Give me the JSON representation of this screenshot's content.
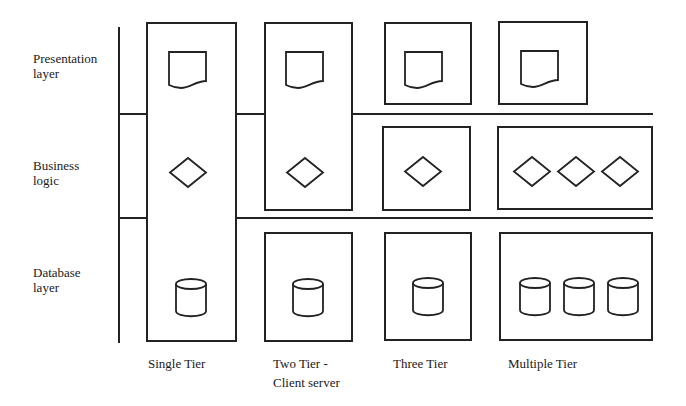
{
  "diagram": {
    "type": "tier-architecture-comparison",
    "rows": [
      {
        "id": "presentation",
        "label_line1": "Presentation",
        "label_line2": "layer"
      },
      {
        "id": "business",
        "label_line1": "Business",
        "label_line2": "logic"
      },
      {
        "id": "database",
        "label_line1": "Database",
        "label_line2": "layer"
      }
    ],
    "columns": [
      {
        "id": "single",
        "label_line1": "Single Tier",
        "label_line2": ""
      },
      {
        "id": "two",
        "label_line1": "Two Tier -",
        "label_line2": "Client server"
      },
      {
        "id": "three",
        "label_line1": "Three Tier",
        "label_line2": ""
      },
      {
        "id": "multiple",
        "label_line1": "Multiple Tier",
        "label_line2": ""
      }
    ],
    "icons": {
      "presentation": "document-icon",
      "business": "diamond-icon",
      "database": "cylinder-icon"
    },
    "cells": {
      "single": {
        "boxes": [
          {
            "spans": [
              "presentation",
              "business",
              "database"
            ],
            "documents": 1,
            "diamonds": 1,
            "cylinders": 1
          }
        ]
      },
      "two": {
        "boxes": [
          {
            "spans": [
              "presentation",
              "business"
            ],
            "documents": 1,
            "diamonds": 1
          },
          {
            "spans": [
              "database"
            ],
            "cylinders": 1
          }
        ]
      },
      "three": {
        "boxes": [
          {
            "spans": [
              "presentation"
            ],
            "documents": 1
          },
          {
            "spans": [
              "business"
            ],
            "diamonds": 1
          },
          {
            "spans": [
              "database"
            ],
            "cylinders": 1
          }
        ]
      },
      "multiple": {
        "boxes": [
          {
            "spans": [
              "presentation"
            ],
            "documents": 1
          },
          {
            "spans": [
              "business"
            ],
            "diamonds": 3
          },
          {
            "spans": [
              "database"
            ],
            "cylinders": 3
          }
        ]
      }
    },
    "colors": {
      "line": "#222222",
      "background": "#ffffff",
      "text": "#1a1a1a"
    }
  }
}
